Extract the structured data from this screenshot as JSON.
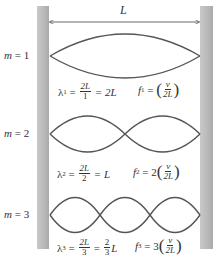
{
  "diagram": {
    "length_label": "L",
    "colors": {
      "wall": "#b8b8b8",
      "wave": "#555555",
      "text": "#333333"
    },
    "modes": [
      {
        "m_label": "m = 1",
        "m_var": "m",
        "m_value": "= 1",
        "lambda_sym": "λ",
        "lambda_sub": "1",
        "frac_num": "2L",
        "frac_den": "1",
        "lambda_result": "= 2L",
        "f_sym": "f",
        "f_sub": "1",
        "f_coef": "",
        "v_num": "v",
        "v_den": "2L",
        "loops": 1
      },
      {
        "m_label": "m = 2",
        "m_var": "m",
        "m_value": "= 2",
        "lambda_sym": "λ",
        "lambda_sub": "2",
        "frac_num": "2L",
        "frac_den": "2",
        "lambda_result": "= L",
        "f_sym": "f",
        "f_sub": "2",
        "f_coef": "2",
        "v_num": "v",
        "v_den": "2L",
        "loops": 2
      },
      {
        "m_label": "m = 3",
        "m_var": "m",
        "m_value": "= 3",
        "lambda_sym": "λ",
        "lambda_sub": "3",
        "frac_num": "2L",
        "frac_den": "3",
        "lambda_result_pre": "=",
        "lambda_result_frac_num": "2",
        "lambda_result_frac_den": "3",
        "lambda_result_post": "L",
        "f_sym": "f",
        "f_sub": "3",
        "f_coef": "3",
        "v_num": "v",
        "v_den": "2L",
        "loops": 3
      }
    ]
  }
}
